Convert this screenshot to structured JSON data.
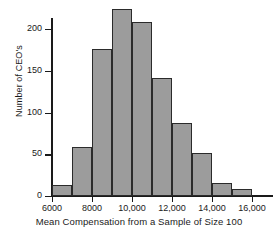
{
  "chart_data": {
    "type": "bar",
    "title": "",
    "subtitle": "",
    "xlabel": "Mean Compensation from a Sample of Size 100",
    "ylabel": "Number of CEO's",
    "xlim": [
      6000,
      17000
    ],
    "ylim": [
      0,
      230
    ],
    "grid": false,
    "legend": null,
    "bin_width": 1000,
    "bin_edges": [
      6000,
      7000,
      8000,
      9000,
      10000,
      11000,
      12000,
      13000,
      14000,
      15000,
      16000
    ],
    "categories": [
      "6000-7000",
      "7000-8000",
      "8000-9000",
      "9000-10,000",
      "10,000-11,000",
      "11,000-12,000",
      "12,000-13,000",
      "13,000-14,000",
      "14,000-15,000",
      "15,000-16,000"
    ],
    "values": [
      13,
      59,
      176,
      224,
      209,
      141,
      87,
      51,
      16,
      8
    ],
    "xticks": [
      6000,
      8000,
      10000,
      12000,
      14000,
      16000
    ],
    "xtick_labels": [
      "6000",
      "8000",
      "10,000",
      "12,000",
      "14,000",
      "16,000"
    ],
    "yticks": [
      0,
      50,
      100,
      150,
      200
    ],
    "ytick_labels": [
      "0",
      "50",
      "100",
      "150",
      "200"
    ],
    "bar_fill_color": "#9c9c9c",
    "bar_edge_color": "#2b2b2b",
    "axis_color": "#1a1a1a",
    "background_color": "#ffffff"
  }
}
